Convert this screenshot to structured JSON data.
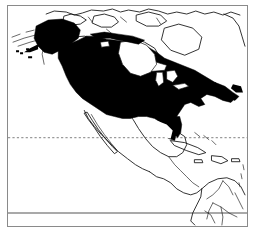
{
  "figure": {
    "kind": "distribution-range-map",
    "region": "North America",
    "shaded_meaning": "species range (solid black)",
    "background_color": "#ffffff",
    "range_fill_color": "#000000",
    "coastline_color": "#111111",
    "frame_color": "#8a8a8a",
    "graticule_color": "#8c8c8c"
  },
  "frame": {
    "left": 7,
    "top": 5,
    "width": 241,
    "height": 222,
    "border_width_px": 1.4
  },
  "graticule": {
    "lines": [
      {
        "name": "tropic-of-cancer",
        "style": "dashed",
        "y": 131,
        "label": ""
      },
      {
        "name": "equator",
        "style": "solid",
        "y": 206,
        "label": ""
      }
    ]
  },
  "labels": {
    "title": "",
    "caption": "",
    "legend": ""
  },
  "chart_data": {
    "type": "map",
    "title": "",
    "projection": "unspecified",
    "series": [
      {
        "name": "range",
        "fill": "#000000",
        "coverage_description": "Alaska, most of Canada, and the contiguous United States; absent from far northern Canadian Arctic islands, Greenland, Mexico, Central America, the Caribbean and South America"
      }
    ],
    "reference_lines": [
      {
        "name": "tropic-of-cancer",
        "style": "dashed"
      },
      {
        "name": "equator",
        "style": "solid"
      }
    ]
  }
}
